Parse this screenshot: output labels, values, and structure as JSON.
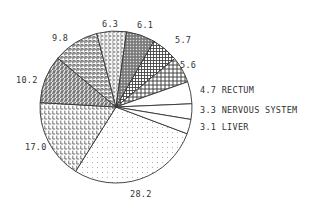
{
  "chart_data": {
    "type": "pie",
    "title": "",
    "start_angle_deg": 20.6,
    "direction": "clockwise",
    "center": [
      116,
      107
    ],
    "radius": 76,
    "slices": [
      {
        "value": 28.2,
        "label": "28.2",
        "name": "",
        "pattern": "dots"
      },
      {
        "value": 17.0,
        "label": "17.0",
        "name": "",
        "pattern": "L"
      },
      {
        "value": 10.2,
        "label": "10.2",
        "name": "",
        "pattern": "S"
      },
      {
        "value": 9.8,
        "label": "9.8",
        "name": "",
        "pattern": "P"
      },
      {
        "value": 6.3,
        "label": "6.3",
        "name": "",
        "pattern": "C"
      },
      {
        "value": 6.1,
        "label": "6.1",
        "name": "",
        "pattern": "darkgrid"
      },
      {
        "value": 5.7,
        "label": "5.7",
        "name": "",
        "pattern": "grid"
      },
      {
        "value": 5.6,
        "label": "5.6",
        "name": "",
        "pattern": "crosshatch"
      },
      {
        "value": 4.7,
        "label": "4.7 RECTUM",
        "name": "RECTUM",
        "pattern": "none"
      },
      {
        "value": 3.3,
        "label": "3.3 NERVOUS SYSTEM",
        "name": "NERVOUS SYSTEM",
        "pattern": "none"
      },
      {
        "value": 3.1,
        "label": "3.1 LIVER",
        "name": "LIVER",
        "pattern": "none"
      }
    ],
    "label_positions": [
      [
        130,
        197
      ],
      [
        25,
        150
      ],
      [
        16,
        83
      ],
      [
        52,
        41
      ],
      [
        102,
        27
      ],
      [
        137,
        28
      ],
      [
        175,
        43
      ],
      [
        180,
        68
      ],
      [
        200,
        93
      ],
      [
        200,
        113
      ],
      [
        200,
        130
      ]
    ],
    "legend": "none",
    "grid": false
  }
}
